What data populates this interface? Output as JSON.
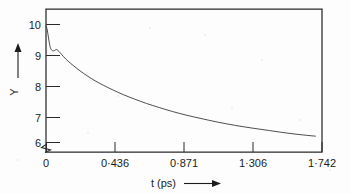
{
  "chart_data": {
    "type": "line",
    "title": "",
    "xlabel": "t (ps)",
    "ylabel": "Y",
    "xlim": [
      0,
      1.742
    ],
    "ylim": [
      5.75,
      10.35
    ],
    "grid": false,
    "legend": null,
    "x_ticks": [
      0,
      0.436,
      0.871,
      1.306,
      1.742
    ],
    "x_tick_labels": [
      "0",
      "0·436",
      "0·871",
      "1·306",
      "1·742"
    ],
    "y_ticks": [
      6,
      7,
      8,
      9,
      10
    ],
    "y_tick_labels": [
      "6",
      "7",
      "8",
      "9",
      "10"
    ],
    "y_axis_break": true,
    "series": [
      {
        "name": "Y(t)",
        "color": "#3a3a3a",
        "x": [
          0.0,
          0.006,
          0.012,
          0.018,
          0.024,
          0.03,
          0.038,
          0.046,
          0.055,
          0.065,
          0.075,
          0.09,
          0.11,
          0.14,
          0.175,
          0.215,
          0.26,
          0.31,
          0.365,
          0.425,
          0.49,
          0.56,
          0.635,
          0.715,
          0.8,
          0.89,
          0.985,
          1.085,
          1.19,
          1.3,
          1.41,
          1.52,
          1.62,
          1.7
        ],
        "y": [
          9.8,
          9.72,
          9.55,
          9.35,
          9.18,
          9.07,
          9.02,
          9.0,
          9.02,
          9.05,
          9.02,
          8.94,
          8.82,
          8.67,
          8.52,
          8.36,
          8.2,
          8.04,
          7.89,
          7.74,
          7.59,
          7.45,
          7.31,
          7.18,
          7.05,
          6.93,
          6.82,
          6.71,
          6.61,
          6.52,
          6.44,
          6.36,
          6.3,
          6.26
        ]
      }
    ],
    "annotations": {
      "y_axis_arrow": "up-arrow",
      "x_axis_arrow": "right-arrow"
    }
  },
  "axes": {
    "y_label_text": "Y",
    "x_label_text": "t (ps)"
  }
}
